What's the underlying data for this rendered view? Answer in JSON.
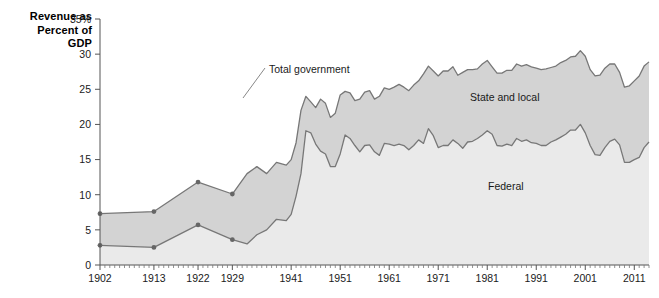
{
  "axis_title": {
    "line1": "Revenue as",
    "line2": "Percent of",
    "line3": "GDP"
  },
  "annotations": {
    "total": "Total government",
    "state_local": "State and local",
    "federal": "Federal"
  },
  "colors": {
    "band_upper": "#d3d3d3",
    "band_lower": "#eaeaea",
    "line": "#777777",
    "axis": "#555555",
    "text": "#1a1a1a"
  },
  "chart_data": {
    "type": "area",
    "title": "",
    "xlabel": "",
    "ylabel": "Revenue as Percent of GDP",
    "ylim": [
      0,
      35
    ],
    "xlim": [
      1902,
      2014
    ],
    "grid": false,
    "legend_position": "inline-annotations",
    "ytick_labels": [
      "0",
      "5",
      "10",
      "15",
      "20",
      "25",
      "30",
      "35%"
    ],
    "yticks": [
      0,
      5,
      10,
      15,
      20,
      25,
      30,
      35
    ],
    "xtick_labels": [
      "1902",
      "1913",
      "1922",
      "1929",
      "1941",
      "1951",
      "1961",
      "1971",
      "1981",
      "1991",
      "2001",
      "2011"
    ],
    "xticks": [
      1902,
      1913,
      1922,
      1929,
      1941,
      1951,
      1961,
      1971,
      1981,
      1991,
      2001,
      2011
    ],
    "marker_years": [
      1902,
      1913,
      1922,
      1929
    ],
    "x": [
      1902,
      1913,
      1922,
      1929,
      1932,
      1934,
      1936,
      1938,
      1940,
      1941,
      1942,
      1943,
      1944,
      1945,
      1946,
      1947,
      1948,
      1949,
      1950,
      1951,
      1952,
      1953,
      1954,
      1955,
      1956,
      1957,
      1958,
      1959,
      1960,
      1961,
      1962,
      1963,
      1964,
      1965,
      1966,
      1967,
      1968,
      1969,
      1970,
      1971,
      1972,
      1973,
      1974,
      1975,
      1976,
      1977,
      1978,
      1979,
      1980,
      1981,
      1982,
      1983,
      1984,
      1985,
      1986,
      1987,
      1988,
      1989,
      1990,
      1991,
      1992,
      1993,
      1994,
      1995,
      1996,
      1997,
      1998,
      1999,
      2000,
      2001,
      2002,
      2003,
      2004,
      2005,
      2006,
      2007,
      2008,
      2009,
      2010,
      2011,
      2012,
      2013,
      2014
    ],
    "series": [
      {
        "name": "Total government",
        "values": [
          7.3,
          7.6,
          11.8,
          10.1,
          13.0,
          14.0,
          13.0,
          14.6,
          14.2,
          15.0,
          17.4,
          22.0,
          24.0,
          23.2,
          22.4,
          23.6,
          23.0,
          21.0,
          21.6,
          24.2,
          24.7,
          24.5,
          23.4,
          23.6,
          24.6,
          24.8,
          23.6,
          24.0,
          25.2,
          25.0,
          25.3,
          25.7,
          25.3,
          24.8,
          25.6,
          26.2,
          27.2,
          28.3,
          27.6,
          26.9,
          27.6,
          27.6,
          28.2,
          27.0,
          27.4,
          27.8,
          27.8,
          27.9,
          28.6,
          29.1,
          28.2,
          27.3,
          27.3,
          27.7,
          27.7,
          28.6,
          28.3,
          28.5,
          28.2,
          28.0,
          27.8,
          27.9,
          28.1,
          28.3,
          28.8,
          29.1,
          29.6,
          29.7,
          30.5,
          29.7,
          27.8,
          26.9,
          27.0,
          28.0,
          28.6,
          28.6,
          27.4,
          25.3,
          25.5,
          26.2,
          26.9,
          28.3,
          28.9
        ]
      },
      {
        "name": "Federal",
        "values": [
          2.8,
          2.5,
          5.7,
          3.6,
          3.0,
          4.3,
          5.0,
          6.5,
          6.3,
          7.2,
          9.8,
          13.0,
          19.1,
          18.8,
          17.2,
          16.2,
          15.8,
          14.0,
          14.0,
          15.8,
          18.5,
          18.0,
          17.0,
          16.1,
          17.0,
          17.1,
          16.1,
          15.6,
          17.3,
          17.2,
          17.0,
          17.2,
          17.0,
          16.4,
          17.0,
          17.8,
          17.3,
          19.4,
          18.4,
          16.7,
          17.0,
          17.0,
          17.8,
          17.3,
          16.6,
          17.5,
          17.6,
          18.0,
          18.5,
          19.1,
          18.6,
          17.0,
          16.9,
          17.2,
          17.0,
          18.0,
          17.6,
          17.8,
          17.4,
          17.3,
          17.0,
          17.0,
          17.5,
          17.8,
          18.2,
          18.6,
          19.2,
          19.2,
          20.0,
          18.8,
          17.0,
          15.7,
          15.6,
          16.7,
          17.6,
          17.9,
          17.1,
          14.6,
          14.6,
          15.0,
          15.3,
          16.7,
          17.5
        ]
      }
    ]
  }
}
